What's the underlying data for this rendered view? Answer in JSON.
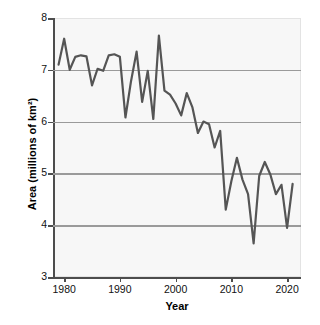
{
  "chart_data": {
    "type": "line",
    "title": "",
    "subtitle": "",
    "xlabel": "Year",
    "ylabel": "Area (millions of km²)",
    "xlim": [
      1978.0,
      2022.5
    ],
    "ylim": [
      3,
      8
    ],
    "grid": true,
    "gridlines_y": [
      4,
      5,
      6,
      7
    ],
    "legend": null,
    "legend_position": "none",
    "line_color": "#555555",
    "line_width_px": 2.2,
    "background_color": "#f7f7f7",
    "axis_color": "#4d4d4d",
    "gridline_color": "#9a9a9a",
    "x_tick_labels": [
      "1980",
      "1990",
      "2000",
      "2010",
      "2020"
    ],
    "x_ticks": [
      1980,
      1990,
      2000,
      2010,
      2020
    ],
    "y_tick_labels": [
      "3",
      "4",
      "5",
      "6",
      "7",
      "8"
    ],
    "y_ticks": [
      3,
      4,
      5,
      6,
      7,
      8
    ],
    "series": [
      {
        "name": "Area",
        "x": [
          1979,
          1980,
          1981,
          1982,
          1983,
          1984,
          1985,
          1986,
          1987,
          1988,
          1989,
          1990,
          1991,
          1992,
          1993,
          1994,
          1995,
          1996,
          1997,
          1998,
          1999,
          2000,
          2001,
          2002,
          2003,
          2004,
          2005,
          2006,
          2007,
          2008,
          2009,
          2010,
          2011,
          2012,
          2013,
          2014,
          2015,
          2016,
          2017,
          2018,
          2019,
          2020,
          2021
        ],
        "values": [
          7.1,
          7.6,
          7.0,
          7.25,
          7.28,
          7.26,
          6.7,
          7.02,
          6.98,
          7.28,
          7.3,
          7.25,
          6.08,
          6.78,
          7.35,
          6.38,
          6.98,
          6.05,
          7.66,
          6.6,
          6.52,
          6.35,
          6.12,
          6.55,
          6.28,
          5.78,
          6.0,
          5.95,
          5.5,
          5.82,
          4.3,
          4.85,
          5.3,
          4.88,
          4.6,
          3.65,
          4.95,
          5.22,
          4.98,
          4.6,
          4.78,
          3.95,
          4.8
        ]
      }
    ],
    "annotations": []
  },
  "axis_titles": {
    "y": "Area (millions of km²)",
    "x": "Year"
  }
}
